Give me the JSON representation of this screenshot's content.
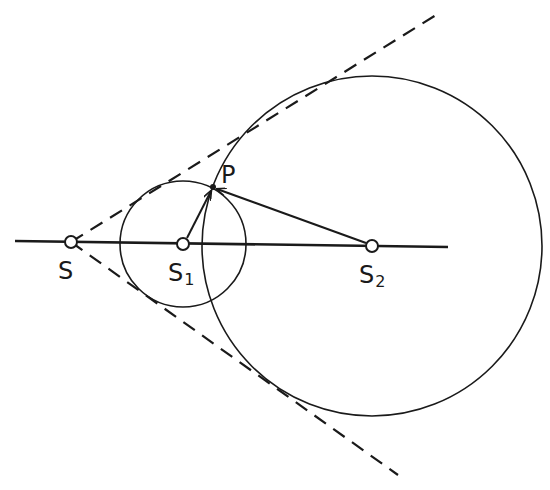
{
  "diagram": {
    "type": "geometry",
    "colors": {
      "ink": "#1a1a1a",
      "background": "#ffffff"
    },
    "points": {
      "S": {
        "label": "S",
        "sub": "",
        "x": 71,
        "y": 242
      },
      "S1": {
        "label": "S",
        "sub": "1",
        "x": 183,
        "y": 244
      },
      "S2": {
        "label": "S",
        "sub": "2",
        "x": 372,
        "y": 246
      },
      "P": {
        "label": "P",
        "x": 213,
        "y": 187
      }
    },
    "circles": [
      {
        "name": "small-circle",
        "center": "S1",
        "cx": 183,
        "cy": 244,
        "r": 63
      },
      {
        "name": "large-circle",
        "center": "S2",
        "cx": 372,
        "cy": 246,
        "r": 170
      }
    ],
    "axis_line": {
      "x1": 15,
      "y1": 241,
      "x2": 448,
      "y2": 247
    },
    "tangents": [
      {
        "name": "upper-tangent",
        "x1": 71,
        "y1": 242,
        "x2": 436,
        "y2": 15,
        "style": "dashed"
      },
      {
        "name": "lower-tangent",
        "x1": 71,
        "y1": 242,
        "x2": 398,
        "y2": 475,
        "style": "dashed"
      }
    ],
    "arrows": [
      {
        "name": "arrow-s1-to-p",
        "from": "S1",
        "to": "P"
      },
      {
        "name": "arrow-s2-to-p",
        "from": "S2",
        "to": "P"
      }
    ]
  }
}
